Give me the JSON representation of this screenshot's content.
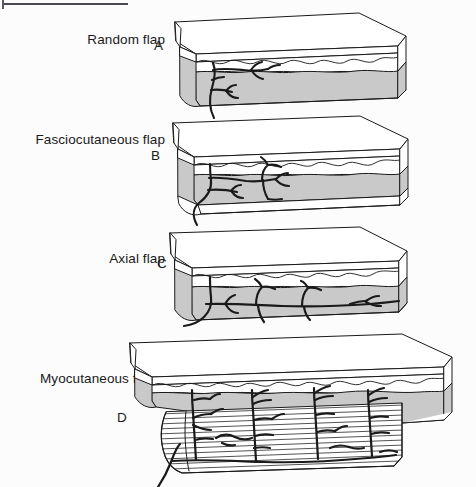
{
  "figure": {
    "background_color": "#fcfcfc",
    "ink_color": "#1a1a1a",
    "fat_fill_color": "#c9c9c9",
    "skin_fill_color": "#ffffff",
    "muscle_fill_color": "#ffffff",
    "rule_color": "#4a4a52"
  },
  "panels": [
    {
      "letter": "A",
      "label": "Random flap",
      "label_lines": [
        "Random flap"
      ],
      "layers": [
        "epidermis",
        "dermis",
        "subcutaneous fat"
      ],
      "vessel_pattern": "random",
      "has_fascia": false,
      "has_muscle": false
    },
    {
      "letter": "B",
      "label": "Fasciocutaneous flap",
      "label_lines": [
        "Fasciocutaneous",
        "flap"
      ],
      "layers": [
        "epidermis",
        "dermis",
        "subcutaneous fat",
        "fascia"
      ],
      "vessel_pattern": "fascial plexus",
      "has_fascia": true,
      "has_muscle": false
    },
    {
      "letter": "C",
      "label": "Axial flap",
      "label_lines": [
        "Axial flap"
      ],
      "layers": [
        "epidermis",
        "dermis",
        "subcutaneous fat"
      ],
      "vessel_pattern": "axial",
      "has_fascia": false,
      "has_muscle": false
    },
    {
      "letter": "D",
      "label": "Myocutaneous flap",
      "label_lines": [
        "Myocutaneous",
        "flap"
      ],
      "layers": [
        "epidermis",
        "dermis",
        "subcutaneous fat",
        "muscle"
      ],
      "vessel_pattern": "musculocutaneous perforators",
      "has_fascia": false,
      "has_muscle": true
    }
  ]
}
